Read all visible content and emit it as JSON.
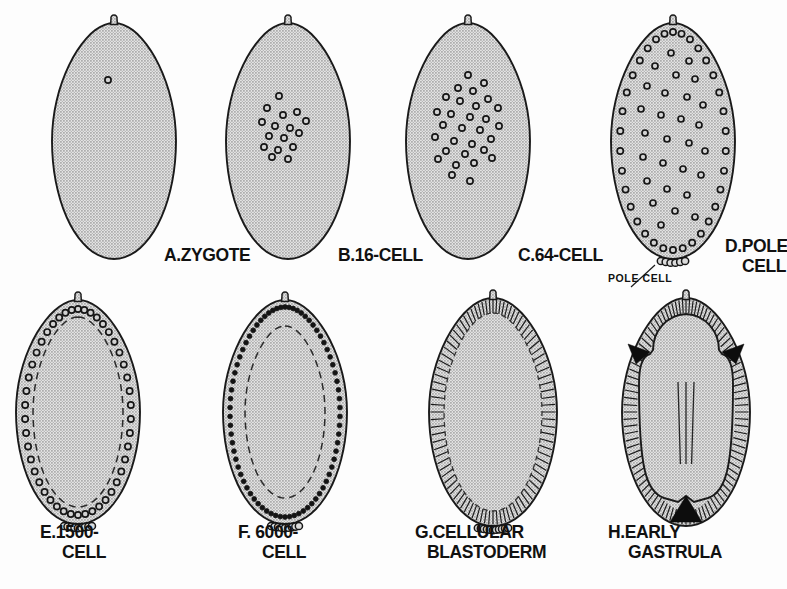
{
  "figure": {
    "background_color": "#fdfdfd",
    "ink_color": "#141414",
    "cytoplasm_color": "#c8c8c8"
  },
  "panels": [
    {
      "id": "A",
      "key": "panel-a-zygote",
      "label_lines": [
        "A.ZYGOTE"
      ],
      "stage_name": "ZYGOTE",
      "nuclei_count": 1,
      "nuclei_style": "open-ring",
      "has_pole_cells": false,
      "has_inner_dashed_contour": false,
      "has_striations": false,
      "cx": 114,
      "cy": 141,
      "rx": 62,
      "ry": 118,
      "label_x": 164,
      "label_y": 261,
      "label_anchor": "start",
      "nuclei": [
        [
          -6,
          -61
        ]
      ]
    },
    {
      "id": "B",
      "key": "panel-b-16-cell",
      "label_lines": [
        "B.16-CELL"
      ],
      "stage_name": "16-CELL",
      "nuclei_count": 16,
      "nuclei_style": "open-ring",
      "has_pole_cells": false,
      "has_inner_dashed_contour": false,
      "has_striations": false,
      "cx": 288,
      "cy": 141,
      "rx": 62,
      "ry": 118,
      "label_x": 338,
      "label_y": 261,
      "label_anchor": "start",
      "nuclei": [
        [
          -9,
          -45
        ],
        [
          -21,
          -33
        ],
        [
          -5,
          -26
        ],
        [
          9,
          -29
        ],
        [
          -26,
          -19
        ],
        [
          -13,
          -15
        ],
        [
          2,
          -13
        ],
        [
          18,
          -20
        ],
        [
          -19,
          -5
        ],
        [
          -4,
          -3
        ],
        [
          11,
          -8
        ],
        [
          -24,
          6
        ],
        [
          -10,
          9
        ],
        [
          5,
          6
        ],
        [
          -16,
          16
        ],
        [
          0,
          18
        ]
      ]
    },
    {
      "id": "C",
      "key": "panel-c-64-cell",
      "label_lines": [
        "C.64-CELL"
      ],
      "stage_name": "64-CELL",
      "nuclei_count": 30,
      "nuclei_style": "open-ring",
      "has_pole_cells": false,
      "has_inner_dashed_contour": false,
      "has_striations": false,
      "cx": 468,
      "cy": 141,
      "rx": 62,
      "ry": 118,
      "label_x": 518,
      "label_y": 261,
      "label_anchor": "start",
      "nuclei": [
        [
          0,
          -66
        ],
        [
          16,
          -58
        ],
        [
          -10,
          -53
        ],
        [
          5,
          -50
        ],
        [
          -22,
          -44
        ],
        [
          20,
          -42
        ],
        [
          -8,
          -40
        ],
        [
          8,
          -35
        ],
        [
          30,
          -33
        ],
        [
          -31,
          -29
        ],
        [
          -17,
          -27
        ],
        [
          2,
          -24
        ],
        [
          18,
          -22
        ],
        [
          -25,
          -16
        ],
        [
          -6,
          -13
        ],
        [
          12,
          -11
        ],
        [
          31,
          -15
        ],
        [
          -33,
          -4
        ],
        [
          -14,
          0
        ],
        [
          4,
          3
        ],
        [
          23,
          -2
        ],
        [
          -22,
          10
        ],
        [
          -3,
          13
        ],
        [
          16,
          9
        ],
        [
          -30,
          18
        ],
        [
          -12,
          24
        ],
        [
          6,
          22
        ],
        [
          24,
          17
        ],
        [
          -16,
          34
        ],
        [
          2,
          40
        ]
      ]
    },
    {
      "id": "D",
      "key": "panel-d-pole-cell",
      "label_lines": [
        "D.POLE",
        "CELL"
      ],
      "stage_name": "POLE CELL",
      "annotation": "POLE CELL",
      "nuclei_count": 58,
      "nuclei_style": "open-ring",
      "has_pole_cells": true,
      "pole_cell_count": 6,
      "has_inner_dashed_contour": false,
      "has_striations": false,
      "cx": 673,
      "cy": 141,
      "rx": 62,
      "ry": 118,
      "label_x": 725,
      "label_y": 252,
      "label_x2": 742,
      "label_y2": 272,
      "label_anchor": "start",
      "annotation_x": 608,
      "annotation_y": 282,
      "cortical_nuclei": 34,
      "interior_nuclei": [
        [
          -2,
          -88
        ],
        [
          16,
          -80
        ],
        [
          -18,
          -75
        ],
        [
          3,
          -66
        ],
        [
          22,
          -62
        ],
        [
          -26,
          -55
        ],
        [
          -8,
          -48
        ],
        [
          14,
          -44
        ],
        [
          30,
          -36
        ],
        [
          -32,
          -32
        ],
        [
          -12,
          -26
        ],
        [
          8,
          -22
        ],
        [
          26,
          -16
        ],
        [
          -28,
          -8
        ],
        [
          -6,
          -2
        ],
        [
          16,
          2
        ],
        [
          32,
          10
        ],
        [
          -30,
          16
        ],
        [
          -10,
          22
        ],
        [
          10,
          28
        ],
        [
          28,
          34
        ],
        [
          -26,
          40
        ],
        [
          -6,
          48
        ],
        [
          14,
          54
        ],
        [
          -20,
          62
        ],
        [
          2,
          70
        ],
        [
          22,
          76
        ],
        [
          -12,
          84
        ]
      ]
    },
    {
      "id": "E",
      "key": "panel-e-1500-cell",
      "label_lines": [
        "E.1500-",
        "CELL"
      ],
      "stage_name": "1500-CELL",
      "nuclei_count": 48,
      "nuclei_style": "open-ring",
      "has_pole_cells": true,
      "pole_cell_count": 9,
      "has_inner_dashed_contour": true,
      "has_striations": false,
      "cx": 78,
      "cy": 412,
      "rx": 62,
      "ry": 112,
      "label_x": 40,
      "label_y": 538,
      "label_x2": 62,
      "label_y2": 558,
      "label_anchor": "start"
    },
    {
      "id": "F",
      "key": "panel-f-6000-cell",
      "label_lines": [
        "F. 6000-",
        "CELL"
      ],
      "stage_name": "6000-CELL",
      "nuclei_count": 72,
      "nuclei_style": "solid-dot",
      "has_pole_cells": true,
      "pole_cell_count": 9,
      "has_inner_dashed_contour": true,
      "has_striations": false,
      "cx": 285,
      "cy": 412,
      "rx": 62,
      "ry": 112,
      "label_x": 238,
      "label_y": 538,
      "label_x2": 262,
      "label_y2": 558,
      "label_anchor": "start"
    },
    {
      "id": "G",
      "key": "panel-g-cellular-blastoderm",
      "label_lines": [
        "G.CELLULAR",
        "BLASTODERM"
      ],
      "stage_name": "CELLULAR BLASTODERM",
      "nuclei_count": 0,
      "nuclei_style": "none",
      "has_pole_cells": true,
      "pole_cell_count": 11,
      "has_inner_dashed_contour": true,
      "has_striations": true,
      "striation_count": 92,
      "cx": 493,
      "cy": 412,
      "rx": 64,
      "ry": 114,
      "label_x": 415,
      "label_y": 538,
      "label_x2": 427,
      "label_y2": 558,
      "label_anchor": "start"
    },
    {
      "id": "H",
      "key": "panel-h-early-gastrula",
      "label_lines": [
        "H.EARLY",
        "GASTRULA"
      ],
      "stage_name": "EARLY GASTRULA",
      "nuclei_count": 0,
      "nuclei_style": "none",
      "has_pole_cells": false,
      "has_inner_dashed_contour": false,
      "has_striations": true,
      "striation_count": 96,
      "has_furrows": true,
      "furrow_count": 3,
      "germband_lines": 3,
      "cx": 686,
      "cy": 412,
      "rx": 64,
      "ry": 114,
      "label_x": 608,
      "label_y": 538,
      "label_x2": 628,
      "label_y2": 558,
      "label_anchor": "start"
    }
  ]
}
